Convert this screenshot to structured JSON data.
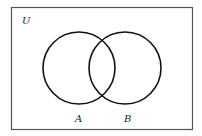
{
  "diagram": {
    "type": "venn",
    "universe": {
      "label": "U",
      "x": 11,
      "y": 7,
      "width": 181,
      "height": 122
    },
    "sets": [
      {
        "label": "A",
        "cx": 79,
        "cy": 68,
        "r": 36,
        "label_x": 75,
        "label_y": 122
      },
      {
        "label": "B",
        "cx": 125,
        "cy": 68,
        "r": 36,
        "label_x": 124,
        "label_y": 122
      }
    ],
    "colors": {
      "stroke": "#111111",
      "frame": "#555555",
      "background": "#ffffff"
    }
  }
}
